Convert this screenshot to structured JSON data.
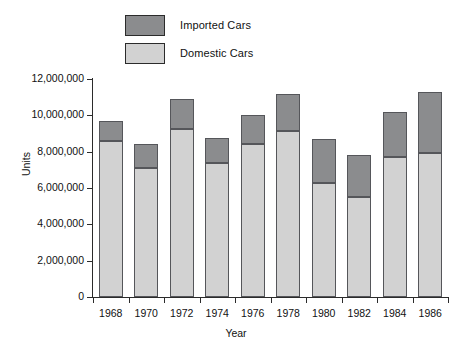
{
  "chart_data": {
    "type": "bar",
    "subtype": "stacked-vertical",
    "title": "",
    "xlabel": "Year",
    "ylabel": "Units",
    "categories": [
      "1968",
      "1970",
      "1972",
      "1974",
      "1976",
      "1978",
      "1980",
      "1982",
      "1984",
      "1986"
    ],
    "series": [
      {
        "name": "Domestic Cars",
        "color": "#d2d2d2",
        "values": [
          8600000,
          7100000,
          9250000,
          7350000,
          8450000,
          9150000,
          6300000,
          5500000,
          7700000,
          7950000
        ]
      },
      {
        "name": "Imported Cars",
        "color": "#8b8c8e",
        "values": [
          1100000,
          1350000,
          1650000,
          1400000,
          1550000,
          2050000,
          2400000,
          2300000,
          2500000,
          3350000
        ]
      }
    ],
    "totals": [
      9700000,
      8450000,
      10900000,
      8750000,
      10000000,
      11200000,
      8700000,
      7800000,
      10200000,
      11300000
    ],
    "ylim": [
      0,
      12000000
    ],
    "ytick_values": [
      0,
      2000000,
      4000000,
      6000000,
      8000000,
      10000000,
      12000000
    ],
    "ytick_labels": [
      "0",
      "2,000,000",
      "4,000,000",
      "6,000,000",
      "8,000,000",
      "10,000,000",
      "12,000,000"
    ],
    "grid": false,
    "legend_position": "top-left-inside"
  },
  "legend": {
    "items": [
      {
        "label": "Imported Cars",
        "color": "#8b8c8e"
      },
      {
        "label": "Domestic Cars",
        "color": "#d2d2d2"
      }
    ]
  },
  "axes": {
    "y_title": "Units",
    "x_title": "Year"
  }
}
